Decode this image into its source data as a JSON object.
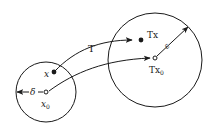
{
  "diagram": {
    "colors": {
      "stroke": "#1a1a1a",
      "background": "#ffffff"
    },
    "domain_circle": {
      "center": [
        46,
        92
      ],
      "radius": 30,
      "points": {
        "x": {
          "label": "x",
          "pos": [
            54,
            72
          ],
          "style": "filled"
        },
        "x0": {
          "label": "x",
          "subscript": "0",
          "pos": [
            46,
            92
          ],
          "style": "hollow"
        }
      },
      "radius_arrow": {
        "label": "δ",
        "from": [
          46,
          92
        ],
        "to": [
          17,
          92
        ]
      }
    },
    "image_circle": {
      "center": [
        155,
        60
      ],
      "radius": 47,
      "points": {
        "Tx": {
          "label": "Tx",
          "pos": [
            141,
            40
          ],
          "style": "filled"
        },
        "Tx0": {
          "label": "Tx",
          "subscript": "0",
          "pos": [
            155,
            58
          ],
          "style": "hollow"
        }
      },
      "radius_arrow": {
        "label": "ε",
        "from": [
          155,
          58
        ],
        "to": [
          188,
          27
        ]
      }
    },
    "mappings": [
      {
        "label": "T",
        "from": "x",
        "to": "Tx"
      },
      {
        "label": "",
        "from": "x0",
        "to": "Tx0"
      }
    ]
  }
}
